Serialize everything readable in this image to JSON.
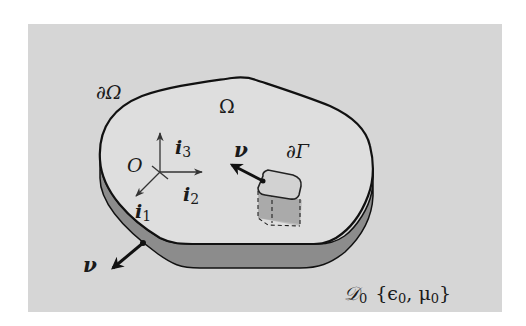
{
  "colors": {
    "page_background": "#ffffff",
    "ambient_region": "#d6d6d6",
    "domain_top_surface": "#dedede",
    "domain_side_band": "#8c8c8c",
    "outline": "#111111",
    "axis": "#333333"
  },
  "labels": {
    "boundary": "∂Ω",
    "domain": "Ω",
    "origin": "O",
    "axis_i3_base": "i",
    "axis_i3_sub": "3",
    "axis_i2_base": "i",
    "axis_i2_sub": "2",
    "axis_i1_base": "i",
    "axis_i1_sub": "1",
    "normal_inner": "ν",
    "normal_outer": "ν",
    "subboundary": "∂Γ",
    "ambient_symbol": "𝒟",
    "ambient_sub": "0",
    "ambient_params": "{ϵ",
    "ambient_params_sub1": "0",
    "ambient_params_mid": ", μ",
    "ambient_params_sub2": "0",
    "ambient_params_close": "}"
  }
}
